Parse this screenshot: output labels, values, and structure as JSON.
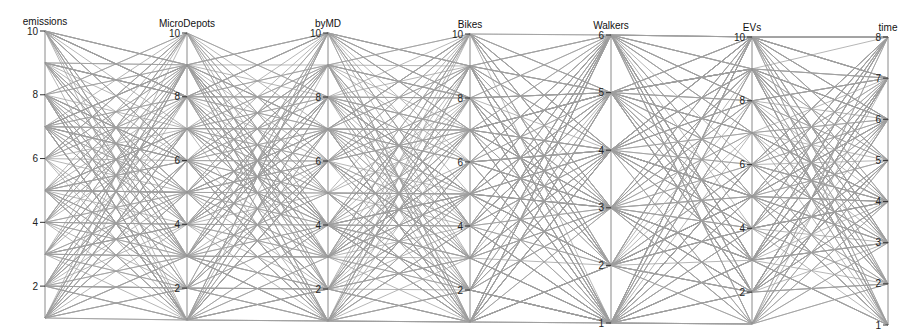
{
  "chart_data": {
    "type": "parallel_coordinates",
    "title": "",
    "line_color": "#9e9e9e",
    "axes": [
      {
        "name": "emissions",
        "label": "emissions",
        "x": 45,
        "min": 1,
        "max": 10,
        "ticks": [
          2,
          4,
          6,
          8,
          10
        ],
        "y_max": 31,
        "y_min": 318
      },
      {
        "name": "MicroDepots",
        "label": "MicroDepots",
        "x": 187,
        "min": 1,
        "max": 10,
        "ticks": [
          2,
          4,
          6,
          8,
          10
        ],
        "y_max": 33,
        "y_min": 320
      },
      {
        "name": "byMD",
        "label": "byMD",
        "x": 328,
        "min": 1,
        "max": 10,
        "ticks": [
          2,
          4,
          6,
          8,
          10
        ],
        "y_max": 33,
        "y_min": 321
      },
      {
        "name": "Bikes",
        "label": "Bikes",
        "x": 470,
        "min": 1,
        "max": 10,
        "ticks": [
          2,
          4,
          6,
          8,
          10
        ],
        "y_max": 34,
        "y_min": 322
      },
      {
        "name": "Walkers",
        "label": "Walkers",
        "x": 611,
        "min": 1,
        "max": 6,
        "ticks": [
          1,
          2,
          3,
          4,
          5,
          6
        ],
        "y_max": 35,
        "y_min": 323
      },
      {
        "name": "EVs",
        "label": "EVs",
        "x": 752,
        "min": 1,
        "max": 10,
        "ticks": [
          2,
          4,
          6,
          8,
          10
        ],
        "y_max": 37,
        "y_min": 324
      },
      {
        "name": "time",
        "label": "time",
        "x": 888,
        "min": 1,
        "max": 8,
        "ticks": [
          1,
          2,
          3,
          4,
          5,
          6,
          7,
          8
        ],
        "y_max": 37,
        "y_min": 325
      }
    ],
    "n_lines": 220,
    "note": "Each polyline is one configuration; values are integers spanning each axis range."
  }
}
